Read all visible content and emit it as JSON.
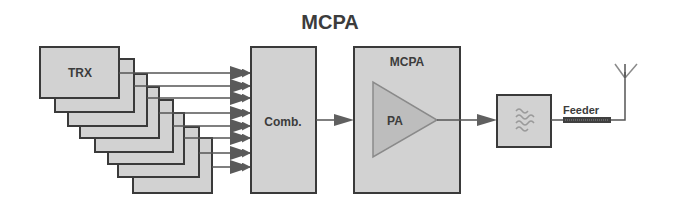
{
  "title": "MCPA",
  "colors": {
    "box_fill": "#d2d2d2",
    "box_stroke": "#3a3a3a",
    "line": "#555555",
    "arrow": "#606060",
    "triangle_fill": "#bdbdbd",
    "feeder_bar": "#404040"
  },
  "blocks": {
    "trx": {
      "label": "TRX",
      "count": 8
    },
    "combiner": {
      "label": "Comb."
    },
    "mcpa": {
      "label": "MCPA"
    },
    "amplifier": {
      "label": "PA"
    },
    "filter": {
      "icon": "filter-icon"
    },
    "feeder": {
      "label": "Feeder"
    },
    "antenna": {
      "icon": "antenna-icon"
    }
  }
}
